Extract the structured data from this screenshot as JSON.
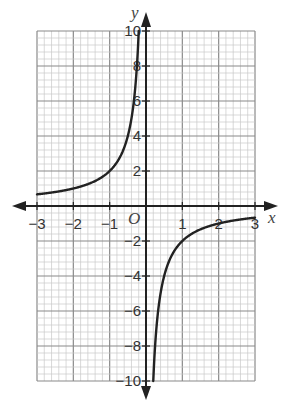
{
  "chart_data": {
    "type": "line",
    "title": "",
    "function": "y = -2/x",
    "xlabel": "x",
    "ylabel": "y",
    "origin_label": "O",
    "xlim": [
      -3,
      3
    ],
    "ylim": [
      -10,
      10
    ],
    "grid": true,
    "x_ticks": [
      -3,
      -2,
      -1,
      1,
      2,
      3
    ],
    "x_tick_labels": [
      "−3",
      "−2",
      "−1",
      "1",
      "2",
      "3"
    ],
    "y_ticks": [
      10,
      8,
      6,
      4,
      2,
      -2,
      -4,
      -6,
      -8,
      -10
    ],
    "y_tick_labels": [
      "10",
      "8",
      "6",
      "4",
      "2",
      "−2",
      "−4",
      "−6",
      "−8",
      "−10"
    ],
    "series": [
      {
        "name": "left branch",
        "x": [
          -3,
          -2.5,
          -2,
          -1.5,
          -1,
          -0.75,
          -0.5,
          -0.4,
          -0.3,
          -0.25,
          -0.2
        ],
        "y": [
          0.67,
          0.8,
          1,
          1.33,
          2,
          2.67,
          4,
          5,
          6.67,
          8,
          10
        ]
      },
      {
        "name": "right branch",
        "x": [
          0.2,
          0.25,
          0.3,
          0.4,
          0.5,
          0.75,
          1,
          1.5,
          2,
          2.5,
          3
        ],
        "y": [
          -10,
          -8,
          -6.67,
          -5,
          -4,
          -2.67,
          -2,
          -1.33,
          -1,
          -0.8,
          -0.67
        ]
      }
    ],
    "colors": {
      "curve": "#222222",
      "axis": "#222222",
      "major_grid": "#8a8a8a",
      "minor_grid": "#c8c8c8"
    }
  }
}
